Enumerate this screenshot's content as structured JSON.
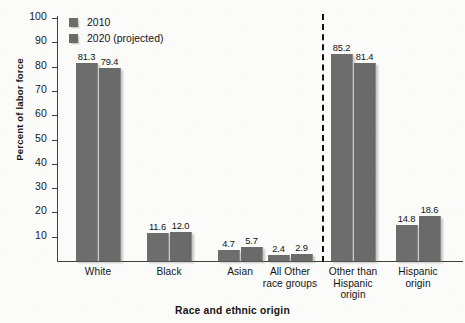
{
  "chart_data": {
    "type": "bar",
    "title": "",
    "xlabel": "Race and ethnic origin",
    "ylabel": "Percent of labor force",
    "ylim": [
      0,
      100
    ],
    "yticks": [
      0,
      10,
      20,
      30,
      40,
      50,
      60,
      70,
      80,
      90,
      100
    ],
    "ytick_labels": [
      "",
      "10",
      "20",
      "30",
      "40",
      "50",
      "60",
      "70",
      "80",
      "90",
      "100"
    ],
    "grid": false,
    "legend_position": "top-left",
    "categories": [
      "White",
      "Black",
      "Asian",
      "All Other race groups",
      "Other than Hispanic origin",
      "Hispanic origin"
    ],
    "category_lines": [
      [
        "White"
      ],
      [
        "Black"
      ],
      [
        "Asian"
      ],
      [
        "All Other",
        "race groups"
      ],
      [
        "Other than",
        "Hispanic",
        "origin"
      ],
      [
        "Hispanic",
        "origin"
      ]
    ],
    "series": [
      {
        "name": "2010",
        "color": "#6d6d6d",
        "values": [
          81.3,
          11.6,
          4.7,
          2.4,
          85.2,
          14.8
        ],
        "labels": [
          "81.3",
          "11.6",
          "4.7",
          "2.4",
          "85.2",
          "14.8"
        ]
      },
      {
        "name": "2020 (projected)",
        "color": "#6a6a6a",
        "values": [
          79.4,
          12.0,
          5.7,
          2.9,
          81.4,
          18.6
        ],
        "labels": [
          "79.4",
          "12.0",
          "5.7",
          "2.9",
          "81.4",
          "18.6"
        ]
      }
    ],
    "annotations": [
      {
        "type": "vertical-dashed-divider",
        "after_category": "All Other race groups",
        "color": "#111111"
      }
    ]
  },
  "legend": {
    "items": [
      {
        "label": "2010",
        "color": "#6d6d6d"
      },
      {
        "label": "2020 (projected)",
        "color": "#6a6a6a"
      }
    ]
  }
}
